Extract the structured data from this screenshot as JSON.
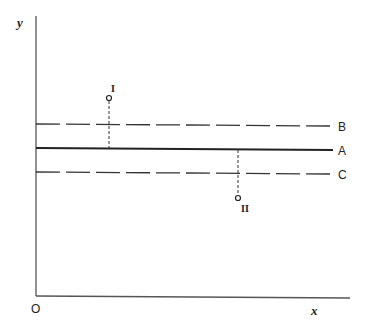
{
  "diagram": {
    "axes": {
      "x_label": "x",
      "y_label": "y",
      "origin_label": "O"
    },
    "lines": [
      {
        "id": "B",
        "label": "B",
        "style": "dashed",
        "y": 124
      },
      {
        "id": "A",
        "label": "A",
        "style": "solid",
        "y": 149
      },
      {
        "id": "C",
        "label": "C",
        "style": "dashed",
        "y": 173
      }
    ],
    "points": [
      {
        "id": "I",
        "label": "I",
        "x": 109,
        "y": 98,
        "position": "above line B"
      },
      {
        "id": "II",
        "label": "II",
        "x": 238,
        "y": 198,
        "position": "below line C"
      }
    ],
    "colors": {
      "ink": "#2a2a2a",
      "background": "#ffffff"
    }
  }
}
